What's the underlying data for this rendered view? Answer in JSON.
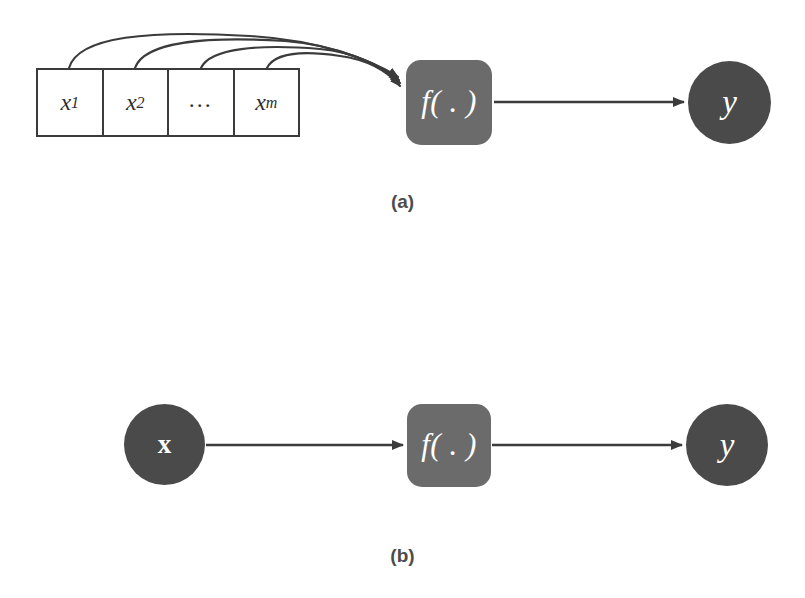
{
  "figure": {
    "background_color": "#ffffff",
    "panels": [
      {
        "id": "a",
        "caption": "(a)",
        "nodes": {
          "vector_cells": [
            {
              "label": "x",
              "subscript": "1"
            },
            {
              "label": "x",
              "subscript": "2"
            },
            {
              "label": "...",
              "subscript": ""
            },
            {
              "label": "x",
              "subscript": "m"
            }
          ],
          "function_box": {
            "label": "f( . )",
            "fill": "#6b6b6b"
          },
          "output_circle": {
            "label": "y",
            "fill": "#4a4a4a"
          }
        },
        "edges": {
          "curved_inputs_count": 4,
          "function_to_output": "straight arrow"
        }
      },
      {
        "id": "b",
        "caption": "(b)",
        "nodes": {
          "input_circle": {
            "label": "x",
            "fill": "#4a4a4a",
            "bold": true
          },
          "function_box": {
            "label": "f( . )",
            "fill": "#6b6b6b"
          },
          "output_circle": {
            "label": "y",
            "fill": "#4a4a4a"
          }
        },
        "edges": {
          "input_to_function": "straight arrow",
          "function_to_output": "straight arrow"
        }
      }
    ],
    "colors": {
      "box_gray": "#6b6b6b",
      "circle_gray": "#4a4a4a",
      "stroke": "#3b3b3b",
      "caption_gray": "#4c4c4c",
      "label_white": "#ffffff"
    }
  }
}
